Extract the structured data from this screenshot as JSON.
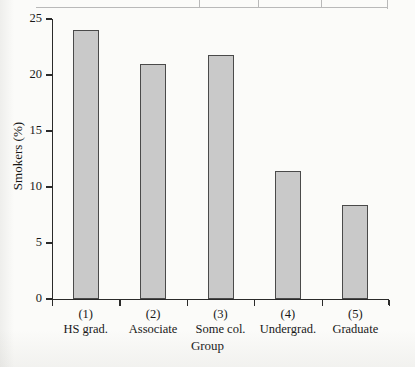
{
  "figure": {
    "background_color": "#fbfbf9",
    "bar_fill_color": "#c9c9c9",
    "bar_edge_color": "#4a4a4a",
    "axis_color": "#2a2a2a"
  },
  "chart_data": {
    "type": "bar",
    "title": "",
    "subtitle": "",
    "xlabel": "Group",
    "ylabel": "Smokers (%)",
    "categories": [
      "(1)",
      "(2)",
      "(3)",
      "(4)",
      "(5)"
    ],
    "category_names": [
      "HS grad.",
      "Associate",
      "Some col.",
      "Undergrad.",
      "Graduate"
    ],
    "category_labels": [
      "(1) HS grad.",
      "(2) Associate",
      "(3) Some col.",
      "(4) Undergrad.",
      "(5) Graduate"
    ],
    "values": [
      24.0,
      21.0,
      21.8,
      11.4,
      8.4
    ],
    "ylim": [
      0,
      25
    ],
    "xlim": [
      0,
      5
    ],
    "ytick_labels": [
      "0",
      "5",
      "10",
      "15",
      "20",
      "25"
    ],
    "ytick_values": [
      0,
      5,
      10,
      15,
      20,
      25
    ],
    "grid": false,
    "legend": false,
    "legend_position": "none"
  },
  "top_fragment": {
    "name": "table-border-fragment",
    "divider_count": 3
  }
}
